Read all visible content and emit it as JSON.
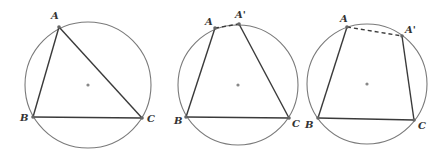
{
  "figures": [
    {
      "id": "fig1",
      "circle": {
        "cx": 88,
        "cy": 85,
        "r": 63
      },
      "points": {
        "A": {
          "x": 59,
          "y": 27,
          "label": "A",
          "lx": 51,
          "ly": 19
        },
        "B": {
          "x": 33,
          "y": 117,
          "label": "B",
          "lx": 20,
          "ly": 121
        },
        "C": {
          "x": 142,
          "y": 118,
          "label": "C",
          "lx": 147,
          "ly": 122
        }
      },
      "segments": [
        [
          "A",
          "B"
        ],
        [
          "B",
          "C"
        ],
        [
          "C",
          "A"
        ]
      ],
      "dashed": []
    },
    {
      "id": "fig2",
      "circle": {
        "cx": 238,
        "cy": 85,
        "r": 60
      },
      "points": {
        "A": {
          "x": 215,
          "y": 28,
          "label": "A",
          "lx": 205,
          "ly": 25
        },
        "A'": {
          "x": 239,
          "y": 24,
          "label": "A'",
          "lx": 235,
          "ly": 18
        },
        "B": {
          "x": 186,
          "y": 117,
          "label": "B",
          "lx": 174,
          "ly": 124
        },
        "C": {
          "x": 289,
          "y": 118,
          "label": "C",
          "lx": 292,
          "ly": 127
        }
      },
      "segments": [
        [
          "A",
          "B"
        ],
        [
          "B",
          "C"
        ],
        [
          "C",
          "A'"
        ]
      ],
      "dashed": [
        [
          "A",
          "A'"
        ]
      ]
    },
    {
      "id": "fig3",
      "circle": {
        "cx": 367,
        "cy": 84,
        "r": 60
      },
      "points": {
        "A": {
          "x": 347,
          "y": 27,
          "label": "A",
          "lx": 340,
          "ly": 22
        },
        "A'": {
          "x": 402,
          "y": 36,
          "label": "A'",
          "lx": 405,
          "ly": 33
        },
        "B": {
          "x": 318,
          "y": 118,
          "label": "B",
          "lx": 305,
          "ly": 128
        },
        "C": {
          "x": 414,
          "y": 120,
          "label": "C",
          "lx": 418,
          "ly": 129
        }
      },
      "segments": [
        [
          "A",
          "B"
        ],
        [
          "B",
          "C"
        ],
        [
          "C",
          "A'"
        ]
      ],
      "dashed": [
        [
          "A",
          "A'"
        ]
      ]
    }
  ],
  "colors": {
    "circle": "#7a7a7a",
    "segment": "#3a3a3a",
    "point": "#666666",
    "center": "#888888"
  }
}
